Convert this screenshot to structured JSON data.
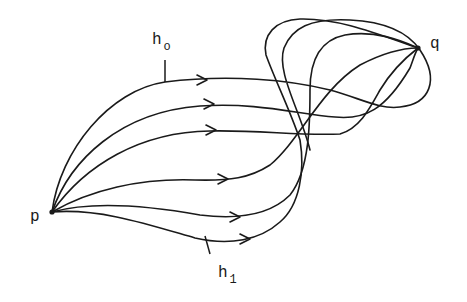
{
  "diagram": {
    "points": {
      "p": {
        "label": "p"
      },
      "q": {
        "label": "q"
      }
    },
    "paths": {
      "h0": {
        "label": "h",
        "subscript": "o"
      },
      "h1": {
        "label": "h",
        "subscript": "1"
      }
    },
    "curve_count": 6,
    "stroke_color": "#1a1a1a",
    "background_color": "#ffffff"
  }
}
